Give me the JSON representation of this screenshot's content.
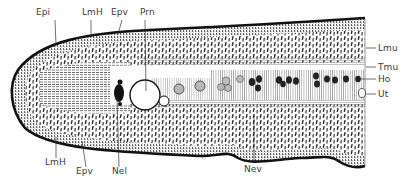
{
  "figure": {
    "colors": {
      "ink": "#1a1a1a",
      "label": "#3a3a3a",
      "background": "#ffffff",
      "cell_fill_light": "#b8b8b8",
      "cell_fill_dark": "#222222"
    }
  },
  "labels": {
    "top": [
      {
        "text": "Epi",
        "x": 36,
        "y": 8
      },
      {
        "text": "LmH",
        "x": 82,
        "y": 8
      },
      {
        "text": "Epv",
        "x": 111,
        "y": 8
      },
      {
        "text": "Prn",
        "x": 140,
        "y": 8
      }
    ],
    "right": [
      {
        "text": "Lmu",
        "x": 378,
        "y": 45
      },
      {
        "text": "Tmu",
        "x": 378,
        "y": 63
      },
      {
        "text": "Ho",
        "x": 378,
        "y": 76
      },
      {
        "text": "Ut",
        "x": 378,
        "y": 90
      }
    ],
    "bottom": [
      {
        "text": "LmH",
        "x": 45,
        "y": 158
      },
      {
        "text": "Epv",
        "x": 76,
        "y": 167
      },
      {
        "text": "Nel",
        "x": 112,
        "y": 167
      },
      {
        "text": "Nev",
        "x": 244,
        "y": 165
      }
    ]
  }
}
